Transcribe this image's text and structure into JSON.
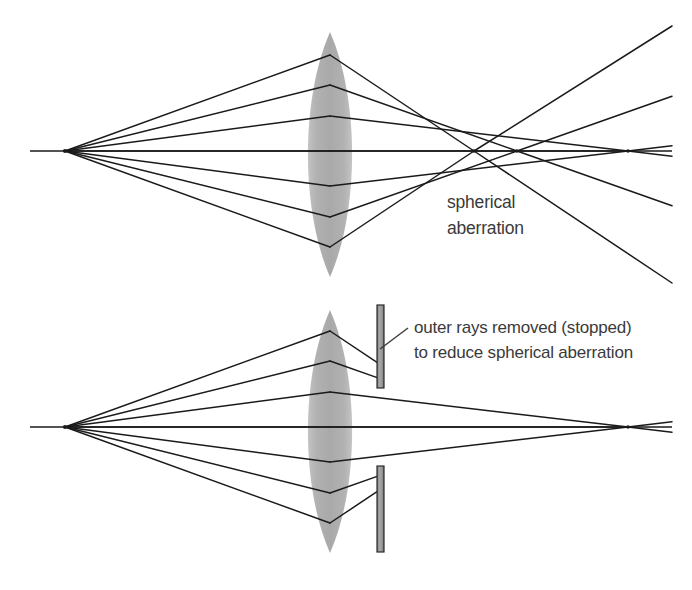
{
  "figure": {
    "background_color": "#ffffff",
    "ray_color": "#1a1a1a",
    "lens_fill_color": "#b0b0b0",
    "stop_fill_color": "#9a9a9a",
    "stop_stroke_color": "#2b2b2b",
    "text_color": "#3a3a3a",
    "axis_color": "#1a1a1a"
  },
  "panels": [
    {
      "id": "top-panel",
      "name": "spherical-aberration-panel",
      "label_lines": [
        "spherical",
        "aberration"
      ],
      "label_position": {
        "x": 447,
        "y": 208
      },
      "label_line_height": 26,
      "source_point": {
        "x": 65,
        "y": 151
      },
      "axis": {
        "x1": 30,
        "y1": 151,
        "x2": 672,
        "y2": 151
      },
      "lens": {
        "center_x": 330,
        "center_y": 151,
        "half_width": 22,
        "top_y": 32,
        "bottom_y": 277
      },
      "rays": [
        {
          "name": "outer-upper",
          "lens_y": 55,
          "focus_x": 474,
          "blocked": false
        },
        {
          "name": "mid-upper",
          "lens_y": 85,
          "focus_x": 517,
          "blocked": false
        },
        {
          "name": "inner-upper",
          "lens_y": 116,
          "focus_x": 628,
          "blocked": false
        },
        {
          "name": "axial",
          "lens_y": 151,
          "focus_x": 628,
          "blocked": false
        },
        {
          "name": "inner-lower",
          "lens_y": 186,
          "focus_x": 628,
          "blocked": false
        },
        {
          "name": "mid-lower",
          "lens_y": 217,
          "focus_x": 517,
          "blocked": false
        },
        {
          "name": "outer-lower",
          "lens_y": 247,
          "focus_x": 474,
          "blocked": false
        }
      ],
      "focal_points": [
        474,
        517,
        628
      ],
      "stops": []
    },
    {
      "id": "bottom-panel",
      "name": "stopped-aperture-panel",
      "label_lines": [
        "outer rays removed (stopped)",
        "to reduce spherical aberration"
      ],
      "label_position": {
        "x": 414,
        "y": 333
      },
      "label_line_height": 25,
      "leader_line": {
        "x1": 408,
        "y1": 328,
        "x2": 380,
        "y2": 349
      },
      "source_point": {
        "x": 65,
        "y": 427
      },
      "axis": {
        "x1": 30,
        "y1": 427,
        "x2": 672,
        "y2": 427
      },
      "lens": {
        "center_x": 330,
        "center_y": 427,
        "half_width": 22,
        "top_y": 310,
        "bottom_y": 553
      },
      "rays": [
        {
          "name": "outer-upper",
          "lens_y": 331,
          "focus_x": 474,
          "blocked": true,
          "stop_x": 380
        },
        {
          "name": "mid-upper",
          "lens_y": 361,
          "focus_x": 517,
          "blocked": true,
          "stop_x": 380
        },
        {
          "name": "inner-upper",
          "lens_y": 392,
          "focus_x": 628,
          "blocked": false
        },
        {
          "name": "axial",
          "lens_y": 427,
          "focus_x": 628,
          "blocked": false
        },
        {
          "name": "inner-lower",
          "lens_y": 462,
          "focus_x": 628,
          "blocked": false
        },
        {
          "name": "mid-lower",
          "lens_y": 493,
          "focus_x": 517,
          "blocked": true,
          "stop_x": 380
        },
        {
          "name": "outer-lower",
          "lens_y": 523,
          "focus_x": 474,
          "blocked": true,
          "stop_x": 380
        }
      ],
      "focal_points": [
        628
      ],
      "stops": [
        {
          "name": "upper-aperture-stop",
          "x": 377,
          "y_top": 305,
          "y_bottom": 388,
          "width": 7
        },
        {
          "name": "lower-aperture-stop",
          "x": 377,
          "y_top": 466,
          "y_bottom": 552,
          "width": 7
        }
      ]
    }
  ]
}
